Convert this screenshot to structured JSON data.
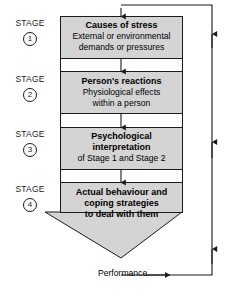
{
  "diagram": {
    "colors": {
      "box_fill": "#d4d4d4",
      "funnel_fill": "#d4d4d4",
      "stroke": "#1b1b1b",
      "background": "#ffffff"
    },
    "stages": [
      {
        "stage_word": "STAGE",
        "number": "1",
        "title": "Causes of stress",
        "lines": [
          "External or environmental",
          "demands or pressures"
        ]
      },
      {
        "stage_word": "STAGE",
        "number": "2",
        "title": "Person's reactions",
        "lines": [
          "Physiological effects",
          "within a person"
        ]
      },
      {
        "stage_word": "STAGE",
        "number": "3",
        "title_line_1": "Psychological",
        "title_line_2": "interpretation",
        "lines": [
          "of Stage 1 and Stage 2"
        ]
      },
      {
        "stage_word": "STAGE",
        "number": "4",
        "title_line_1": "Actual behaviour and",
        "title_line_2": "coping strategies",
        "title_line_3": "to deal with them",
        "lines": []
      }
    ],
    "feedback": {
      "performance_label": "Performance"
    }
  }
}
